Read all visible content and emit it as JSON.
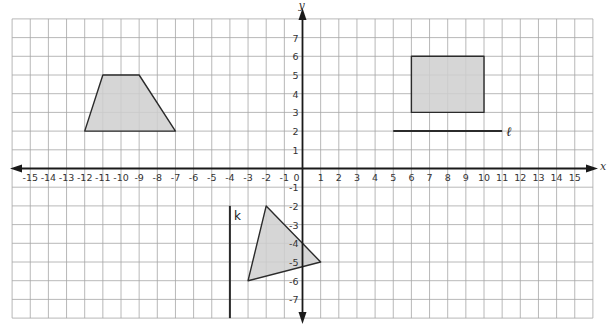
{
  "diagram": {
    "type": "coordinate-plane",
    "x_axis": {
      "label": "x",
      "min": -15,
      "max": 15
    },
    "y_axis": {
      "label": "y",
      "min": -7,
      "max": 7
    },
    "grid": {
      "x_range": [
        -16,
        16
      ],
      "y_range": [
        -8,
        8
      ]
    },
    "colors": {
      "grid": "#a6a6a6",
      "axis": "#1a1a1a",
      "shape_fill": "#cfcfcf",
      "shape_stroke": "#2b2b2b"
    },
    "shapes": [
      {
        "name": "trapezoid",
        "points": [
          [
            -12,
            2
          ],
          [
            -11,
            5
          ],
          [
            -9,
            5
          ],
          [
            -7,
            2
          ]
        ]
      },
      {
        "name": "rectangle",
        "points": [
          [
            6,
            3
          ],
          [
            6,
            6
          ],
          [
            10,
            6
          ],
          [
            10,
            3
          ]
        ]
      },
      {
        "name": "triangle",
        "points": [
          [
            -2,
            -2
          ],
          [
            1,
            -5
          ],
          [
            -3,
            -6
          ]
        ]
      }
    ],
    "lines": [
      {
        "name": "line-l",
        "label": "ℓ",
        "from": [
          5,
          2
        ],
        "to": [
          11,
          2
        ]
      },
      {
        "name": "line-k",
        "label": "k",
        "from": [
          -4,
          -2
        ],
        "to": [
          -4,
          -8
        ]
      }
    ]
  }
}
